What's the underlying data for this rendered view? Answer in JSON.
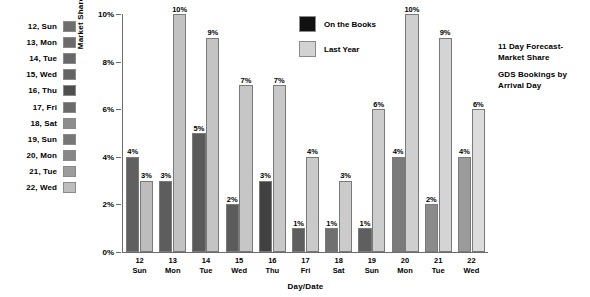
{
  "day_legend": {
    "items": [
      {
        "label": "12, Sun",
        "color": "#6e6e6e"
      },
      {
        "label": "13, Mon",
        "color": "#6b6b6b"
      },
      {
        "label": "14, Tue",
        "color": "#686868"
      },
      {
        "label": "15, Wed",
        "color": "#646464"
      },
      {
        "label": "16, Thu",
        "color": "#4e4e4e"
      },
      {
        "label": "17, Fri",
        "color": "#6a6a6a"
      },
      {
        "label": "18, Sat",
        "color": "#8d8d8d"
      },
      {
        "label": "19, Sun",
        "color": "#767676"
      },
      {
        "label": "20, Mon",
        "color": "#878787"
      },
      {
        "label": "21, Tue",
        "color": "#9c9c9c"
      },
      {
        "label": "22, Wed",
        "color": "#bdbdbd"
      }
    ]
  },
  "series_legend": {
    "items": [
      {
        "label": "On the Books",
        "color": "#111111"
      },
      {
        "label": "Last Year",
        "color": "#d2d2d2"
      }
    ]
  },
  "title_block": {
    "line1": "11 Day Forecast-",
    "line2": "Market  Share",
    "line3": "GDS Bookings by",
    "line4": "Arrival Day"
  },
  "chart_data": {
    "type": "bar",
    "xlabel": "Day/Date",
    "ylabel": "Market Share %",
    "ylim": [
      0,
      10
    ],
    "yticks": [
      "0%",
      "2%",
      "4%",
      "6%",
      "8%",
      "10%"
    ],
    "ytick_values": [
      0,
      2,
      4,
      6,
      8,
      10
    ],
    "grid": false,
    "legend_position": "top-center",
    "categories": [
      "12\nSun",
      "13\nMon",
      "14\nTue",
      "15\nWed",
      "16\nThu",
      "17\nFri",
      "18\nSat",
      "19\nSun",
      "20\nMon",
      "21\nTue",
      "22\nWed"
    ],
    "category_days": [
      "12",
      "13",
      "14",
      "15",
      "16",
      "17",
      "18",
      "19",
      "20",
      "21",
      "22"
    ],
    "category_weekdays": [
      "Sun",
      "Mon",
      "Tue",
      "Wed",
      "Thu",
      "Fri",
      "Sat",
      "Sun",
      "Mon",
      "Tue",
      "Wed"
    ],
    "series": [
      {
        "name": "On the Books",
        "color": "#5f5f5f",
        "values": [
          4,
          3,
          5,
          2,
          3,
          1,
          1,
          1,
          4,
          2,
          4
        ],
        "labels": [
          "4%",
          "3%",
          "5%",
          "2%",
          "3%",
          "1%",
          "1%",
          "1%",
          "4%",
          "2%",
          "4%"
        ],
        "bar_colors": [
          "#606060",
          "#5d5d5d",
          "#5a5a5a",
          "#5c5c5c",
          "#414141",
          "#5e5e5e",
          "#707070",
          "#5f5f5f",
          "#7b7b7b",
          "#8b8b8b",
          "#9b9b9b"
        ]
      },
      {
        "name": "Last Year",
        "color": "#c9c9c9",
        "values": [
          3,
          10,
          9,
          7,
          7,
          4,
          3,
          6,
          10,
          9,
          6
        ],
        "labels": [
          "3%",
          "10%",
          "9%",
          "7%",
          "7%",
          "4%",
          "3%",
          "6%",
          "10%",
          "9%",
          "6%"
        ],
        "bar_colors": [
          "#bdbdbd",
          "#c2c2c2",
          "#c4c4c4",
          "#c6c6c6",
          "#c8c8c8",
          "#cacaca",
          "#cbcbcb",
          "#cdcdcd",
          "#cfcfcf",
          "#d4d4d4",
          "#dcdcdc"
        ]
      }
    ]
  }
}
